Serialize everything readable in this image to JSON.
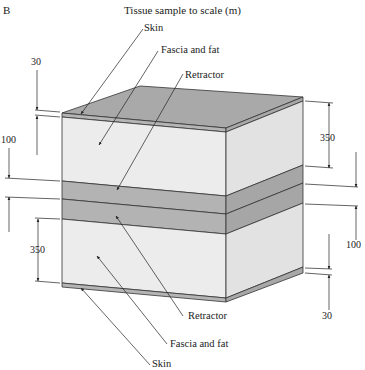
{
  "figure": {
    "panel_label": "B",
    "title": "Tissue sample to scale (m)"
  },
  "labels": {
    "top_skin": "Skin",
    "top_fascia": "Fascia and fat",
    "top_retractor": "Retractor",
    "bottom_retractor": "Retractor",
    "bottom_fascia": "Fascia and fat",
    "bottom_skin": "Skin"
  },
  "dimensions": {
    "left_top_skin": "30",
    "left_upper": "100",
    "left_lower": "350",
    "right_upper": "350",
    "right_middle": "100",
    "right_bottom_skin": "30"
  },
  "layers": [
    {
      "name": "Skin",
      "thickness": 30
    },
    {
      "name": "Fascia and fat",
      "thickness": 350
    },
    {
      "name": "Retractor",
      "thickness": 100
    },
    {
      "name": "Retractor",
      "thickness": 100
    },
    {
      "name": "Fascia and fat",
      "thickness": 350
    },
    {
      "name": "Skin",
      "thickness": 30
    }
  ],
  "colors": {
    "top_face": "#a9a9a9",
    "skin_front": "#b5b5b5",
    "skin_side": "#a8a8a8",
    "fascia_front": "#ececec",
    "fascia_side": "#e2e2e2",
    "retractor_front": "#b3b3b3",
    "retractor_side": "#a6a6a6",
    "line": "#333333"
  }
}
